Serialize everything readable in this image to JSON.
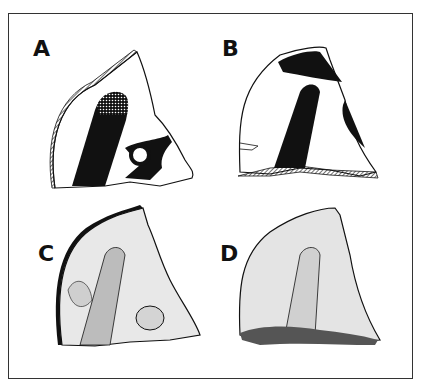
{
  "figure": {
    "panels": [
      {
        "id": "A",
        "label": "A",
        "description": "Sherd, painted decoration outline: black band with cross-hatched tip, ring motif, hatched rim"
      },
      {
        "id": "B",
        "label": "B",
        "description": "Sherd, painted decoration outline: black bands, hatched base"
      },
      {
        "id": "C",
        "label": "C",
        "description": "Sherd, stippled relief rendering with black rim"
      },
      {
        "id": "D",
        "label": "D",
        "description": "Sherd, stippled relief rendering"
      }
    ],
    "colors": {
      "ink": "#111111",
      "paper": "#ffffff",
      "frame": "#333333"
    }
  }
}
